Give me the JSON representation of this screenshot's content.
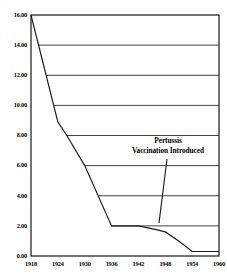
{
  "chart_data": {
    "type": "line",
    "title": "",
    "subtitle": "",
    "xlabel": "",
    "ylabel": "",
    "xlim": [
      1918,
      1960
    ],
    "ylim": [
      0,
      16
    ],
    "grid": true,
    "grid_orientation": "horizontal",
    "legend": false,
    "legend_position": "none",
    "x_ticks": [
      "1918",
      "1924",
      "1930",
      "1936",
      "1942",
      "1948",
      "1954",
      "1960"
    ],
    "x_tick_values": [
      1918,
      1924,
      1930,
      1936,
      1942,
      1948,
      1954,
      1960
    ],
    "y_ticks": [
      "0.00",
      "2.00",
      "4.00",
      "6.00",
      "8.00",
      "10.00",
      "12.00",
      "14.00",
      "16.00"
    ],
    "y_tick_values": [
      0,
      2,
      4,
      6,
      8,
      10,
      12,
      14,
      16
    ],
    "series": [
      {
        "name": "Pertussis mortality rate",
        "x": [
          1918,
          1924,
          1926,
          1930,
          1936,
          1942,
          1946,
          1948,
          1951,
          1954,
          1960
        ],
        "values": [
          16.0,
          8.9,
          8.0,
          6.0,
          2.0,
          2.0,
          1.75,
          1.6,
          1.0,
          0.3,
          0.3
        ]
      }
    ],
    "annotations": [
      {
        "name": "pertussis-vaccination-introduced",
        "line1": "Pertussis",
        "line2": "Vaccination Introduced",
        "points_to_x": 1948,
        "points_to_y": 1.6
      }
    ]
  },
  "colors": {
    "axis": "#000000",
    "grid": "#2b2b2b",
    "line": "#1a1a1a",
    "background": "#ffffff",
    "text": "#000000"
  }
}
